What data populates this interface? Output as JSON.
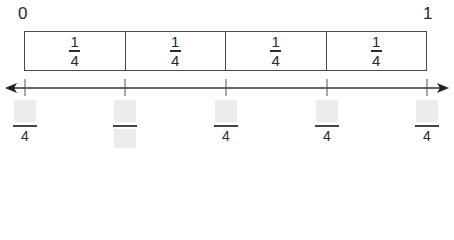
{
  "number_line": {
    "start_label": "0",
    "end_label": "1",
    "segments": [
      {
        "numerator": "1",
        "denominator": "4"
      },
      {
        "numerator": "1",
        "denominator": "4"
      },
      {
        "numerator": "1",
        "denominator": "4"
      },
      {
        "numerator": "1",
        "denominator": "4"
      }
    ],
    "answers": [
      {
        "numerator": "",
        "denominator": "4",
        "denominator_blank": false
      },
      {
        "numerator": "",
        "denominator": "",
        "denominator_blank": true
      },
      {
        "numerator": "",
        "denominator": "4",
        "denominator_blank": false
      },
      {
        "numerator": "",
        "denominator": "4",
        "denominator_blank": false
      },
      {
        "numerator": "",
        "denominator": "4",
        "denominator_blank": false
      }
    ]
  }
}
